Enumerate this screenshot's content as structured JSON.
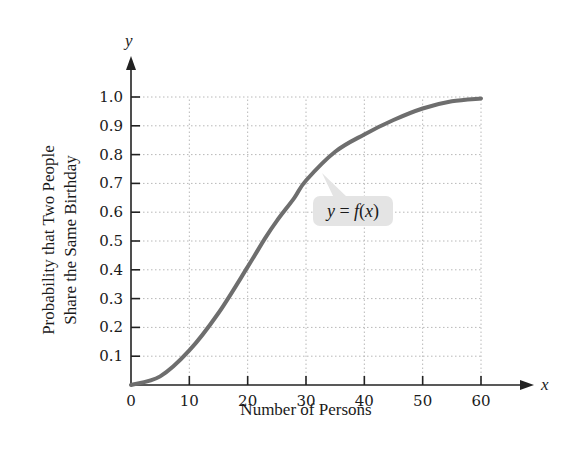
{
  "chart_data": {
    "type": "line",
    "title": "",
    "xlabel": "Number of Persons",
    "ylabel_lines": [
      "Probability that Two People",
      "Share the Same Birthday"
    ],
    "x_axis_var": "x",
    "y_axis_var": "y",
    "xlim": [
      0,
      60
    ],
    "ylim": [
      0,
      1.0
    ],
    "x_ticks": [
      0,
      10,
      20,
      30,
      40,
      50,
      60
    ],
    "x_tick_labels": [
      "0",
      "10",
      "20",
      "30",
      "40",
      "50",
      "60"
    ],
    "y_ticks": [
      0.1,
      0.2,
      0.3,
      0.4,
      0.5,
      0.6,
      0.7,
      0.8,
      0.9,
      1.0
    ],
    "y_tick_labels": [
      "0.1",
      "0.2",
      "0.3",
      "0.4",
      "0.5",
      "0.6",
      "0.7",
      "0.8",
      "0.9",
      "1.0"
    ],
    "grid": true,
    "series": [
      {
        "name": "y = f(x)",
        "x": [
          0,
          5,
          10,
          15,
          20,
          23,
          25,
          28,
          30,
          35,
          40,
          45,
          50,
          55,
          60
        ],
        "y": [
          0,
          0.03,
          0.12,
          0.25,
          0.41,
          0.51,
          0.57,
          0.65,
          0.71,
          0.81,
          0.87,
          0.92,
          0.96,
          0.985,
          0.995
        ]
      }
    ],
    "annotations": [
      {
        "text": "y = f(x)",
        "points_to": {
          "x": 32,
          "y": 0.74
        }
      }
    ]
  }
}
